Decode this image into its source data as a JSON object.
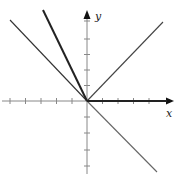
{
  "figure": {
    "width": 175,
    "height": 175,
    "background": "#ffffff",
    "origin": {
      "x": 87,
      "y": 101
    },
    "unit_px": 15.5,
    "axes": {
      "x_label": "x",
      "y_label": "y",
      "axis_color": "#777777",
      "x_ticks_left": 5,
      "x_ticks_right": 4,
      "y_ticks_up": 5,
      "y_ticks_down": 4
    },
    "lines": [
      {
        "name": "steep-line-left",
        "slope": -2,
        "domain": "x<0",
        "weight": "thick",
        "color": "#222222"
      },
      {
        "name": "line-slope-neg1-left",
        "slope": -1,
        "domain": "x<0",
        "weight": "thin",
        "color": "#333333"
      },
      {
        "name": "line-slope-1-right",
        "slope": 1,
        "domain": "x>0",
        "weight": "thin",
        "color": "#444444"
      },
      {
        "name": "line-slope-neg1-right",
        "slope": -1,
        "domain": "x>0",
        "weight": "thin",
        "color": "#666666"
      },
      {
        "name": "ray-positive-x-axis",
        "slope": 0,
        "domain": "x>0",
        "weight": "thick",
        "color": "#222222"
      }
    ]
  }
}
